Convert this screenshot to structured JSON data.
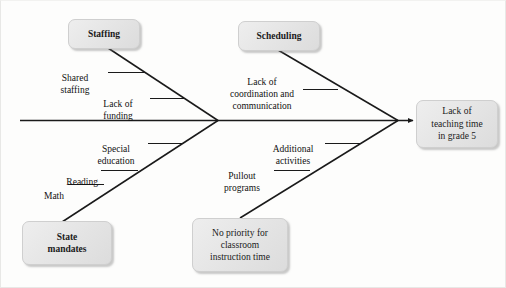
{
  "diagram": {
    "type": "fishbone-ishikawa",
    "title": "",
    "effect": {
      "label": "Lack of\nteaching time\nin grade 5",
      "name": "effect-box"
    },
    "spine": {
      "color": "#1a1a1a",
      "has_arrowhead": true
    },
    "categories": [
      {
        "id": "staffing",
        "label": "Staffing",
        "position": "top-left",
        "causes": [
          {
            "id": "shared-staffing",
            "label": "Shared\nstaffing"
          },
          {
            "id": "lack-of-funding",
            "label": "Lack of\nfunding"
          }
        ]
      },
      {
        "id": "scheduling",
        "label": "Scheduling",
        "position": "top-right",
        "causes": [
          {
            "id": "lack-of-coordination",
            "label": "Lack of\ncoordination and\ncommunication"
          }
        ]
      },
      {
        "id": "state-mandates",
        "label": "State\nmandates",
        "position": "bottom-left",
        "causes": [
          {
            "id": "special-education",
            "label": "Special\neducation"
          },
          {
            "id": "reading",
            "label": "Reading"
          },
          {
            "id": "math",
            "label": "Math"
          }
        ]
      },
      {
        "id": "no-priority",
        "label": "No priority for\nclassroom\ninstruction time",
        "position": "bottom-right",
        "causes": [
          {
            "id": "additional-activities",
            "label": "Additional\nactivities"
          },
          {
            "id": "pullout-programs",
            "label": "Pullout\nprograms"
          }
        ]
      }
    ],
    "colors": {
      "box_fill": "#e6e6e6",
      "box_border": "#cfcfcf",
      "line": "#1a1a1a",
      "text": "#111111",
      "background": "#fdfdfc"
    }
  }
}
